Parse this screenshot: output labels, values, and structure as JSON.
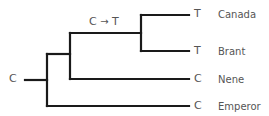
{
  "diagram": {
    "type": "phylogenetic-tree",
    "root_state": "C",
    "mutation": {
      "from": "C",
      "to": "T",
      "arrow": "→",
      "label": "C → T"
    },
    "taxa": [
      {
        "name": "Canada",
        "state": "T"
      },
      {
        "name": "Brant",
        "state": "T"
      },
      {
        "name": "Nene",
        "state": "C"
      },
      {
        "name": "Emperor",
        "state": "C"
      }
    ],
    "colors": {
      "branch": "#1a1a1a",
      "text": "#555555"
    }
  }
}
